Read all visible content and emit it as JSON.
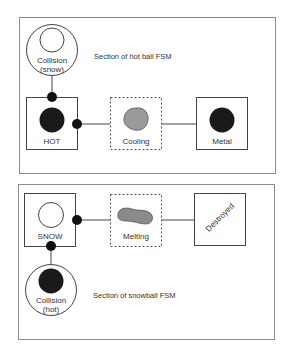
{
  "colors": {
    "stroke": "#444444",
    "panel_border": "#8a8a8a",
    "hot_fill": "#1a1a1a",
    "transition_fill": "#9a9a9a",
    "snow_fill": "#ffffff"
  },
  "hot_ball_fsm": {
    "caption": "Section of hot ball FSM",
    "trigger": {
      "label_line1": "Collision",
      "label_line2": "(snow)"
    },
    "states": [
      {
        "id": "hot",
        "label": "HOT",
        "type": "state"
      },
      {
        "id": "cooling",
        "label": "Cooling",
        "type": "transition"
      },
      {
        "id": "metal",
        "label": "Metal",
        "type": "state"
      }
    ]
  },
  "snowball_fsm": {
    "caption": "Section of snowball FSM",
    "trigger": {
      "label_line1": "Collision",
      "label_line2": "(hot)"
    },
    "states": [
      {
        "id": "snow",
        "label": "SNOW",
        "type": "state"
      },
      {
        "id": "melting",
        "label": "Melting",
        "type": "transition"
      },
      {
        "id": "destroyed",
        "label": "Destroyed",
        "type": "state"
      }
    ]
  }
}
